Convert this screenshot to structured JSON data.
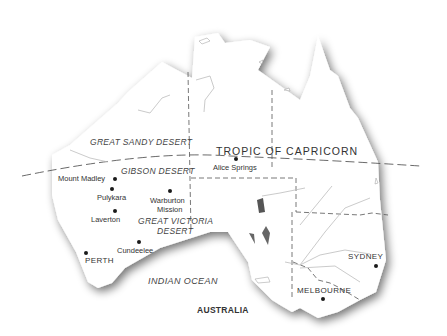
{
  "map": {
    "title": "AUSTRALIA",
    "tropic_line_label": "TROPIC OF CAPRICORN",
    "ocean_label": "INDIAN OCEAN",
    "colors": {
      "land": "#ffffff",
      "coast_shadow": "#8a8a8a",
      "boundary": "#555555",
      "river": "#b5b5b5",
      "text": "#333333"
    },
    "deserts": [
      {
        "name": "GREAT SANDY DESERT"
      },
      {
        "name": "GIBSON DESERT"
      },
      {
        "name": "GREAT VICTORIA",
        "name_line2": "DESERT"
      }
    ],
    "places": [
      {
        "name": "Mount Madley"
      },
      {
        "name": "Pulykara"
      },
      {
        "name": "Warburton",
        "name_line2": "Mission"
      },
      {
        "name": "Laverton"
      },
      {
        "name": "Cundeelee"
      },
      {
        "name": "Alice Springs"
      },
      {
        "name": "PERTH"
      },
      {
        "name": "SYDNEY"
      },
      {
        "name": "MELBOURNE"
      }
    ]
  }
}
